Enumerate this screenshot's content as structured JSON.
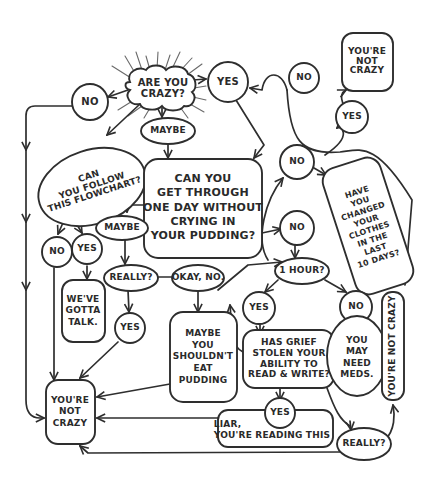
{
  "diagram": {
    "type": "flowchart",
    "style": "hand-drawn black ink on white",
    "colors": {
      "background": "#ffffff",
      "ink": "#2e2e2e",
      "rays": "#6a6a6a"
    },
    "nodes": {
      "start": {
        "text": "ARE YOU\nCRAZY?",
        "shape": "cloud-with-rays"
      },
      "no_top": {
        "text": "NO",
        "shape": "circle"
      },
      "yes_top": {
        "text": "YES",
        "shape": "circle"
      },
      "no_top_right": {
        "text": "NO",
        "shape": "circle"
      },
      "not_crazy_top": {
        "text": "YOU'RE\nNOT\nCRAZY",
        "shape": "rounded-box"
      },
      "yes_right": {
        "text": "YES",
        "shape": "circle"
      },
      "maybe_top": {
        "text": "MAYBE",
        "shape": "ellipse"
      },
      "follow_flowchart": {
        "text": "CAN\nYOU FOLLOW\nTHIS FLOWCHART?",
        "shape": "ellipse"
      },
      "pudding_question": {
        "text": "CAN YOU\nGET THROUGH\nONE DAY WITHOUT\nCRYING IN\nYOUR PUDDING?",
        "shape": "rounded-box"
      },
      "no_mid_upper": {
        "text": "NO",
        "shape": "circle"
      },
      "clothes_question": {
        "text": "HAVE\nYOU\nCHANGED\nYOUR\nCLOTHES\nIN THE\nLAST\n10 DAYS?",
        "shape": "rotated-rounded-box"
      },
      "maybe_mid": {
        "text": "MAYBE",
        "shape": "ellipse"
      },
      "no_mid": {
        "text": "NO",
        "shape": "circle"
      },
      "no_follow": {
        "text": "NO",
        "shape": "circle"
      },
      "yes_follow": {
        "text": "YES",
        "shape": "circle"
      },
      "one_hour": {
        "text": "1 HOUR?",
        "shape": "ellipse"
      },
      "really_mid": {
        "text": "REALLY?",
        "shape": "ellipse"
      },
      "okay_no": {
        "text": "OKAY, NO.",
        "shape": "ellipse"
      },
      "gotta_talk": {
        "text": "WE'VE\nGOTTA\nTALK.",
        "shape": "rounded-box"
      },
      "yes_really": {
        "text": "YES",
        "shape": "circle"
      },
      "shouldnt_eat": {
        "text": "MAYBE\nYOU\nSHOULDN'T\nEAT\nPUDDING",
        "shape": "rounded-box"
      },
      "yes_hour": {
        "text": "YES",
        "shape": "circle"
      },
      "no_hour": {
        "text": "NO",
        "shape": "circle"
      },
      "grief_question": {
        "text": "HAS GRIEF\nSTOLEN YOUR\nABILITY TO\nREAD & WRITE?",
        "shape": "rounded-box"
      },
      "need_meds": {
        "text": "YOU\nMAY\nNEED\nMEDS.",
        "shape": "ellipse"
      },
      "not_crazy_vertical": {
        "text": "YOU'RE NOT CRAZY",
        "shape": "vertical-rounded-box"
      },
      "not_crazy_bottom": {
        "text": "YOU'RE\nNOT\nCRAZY",
        "shape": "rounded-box"
      },
      "yes_grief": {
        "text": "YES",
        "shape": "circle"
      },
      "liar": {
        "text": "LIAR,\nYOU'RE READING THIS",
        "shape": "rounded-box"
      },
      "really_bottom": {
        "text": "REALLY?",
        "shape": "ellipse"
      }
    }
  }
}
